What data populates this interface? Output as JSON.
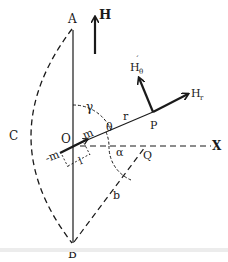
{
  "figure": {
    "colors": {
      "ink": "#1a1a1a",
      "background": "#ffffff",
      "band": "#ececec"
    },
    "points": {
      "A": "A",
      "B": "B",
      "C": "C",
      "O": "O",
      "P": "P",
      "Q": "Q",
      "X": "X"
    },
    "vectors": {
      "H": "H",
      "H_r": "H",
      "H_r_sub": "r",
      "H_theta": "H",
      "H_theta_sub": "θ",
      "H_theta_accent": "´"
    },
    "labels": {
      "r": "r",
      "m": "m",
      "neg_m": "-m",
      "l": "l",
      "b": "b"
    },
    "angles": {
      "gamma": "γ",
      "theta": "θ",
      "alpha": "α"
    }
  }
}
